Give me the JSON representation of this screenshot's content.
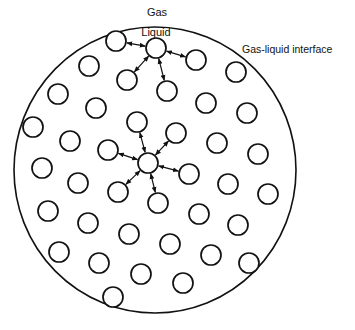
{
  "labels": {
    "gas": "Gas",
    "liquid": "Liquid",
    "interface": "Gas-liquid interface"
  },
  "colors": {
    "stroke": "#111111",
    "background": "#ffffff"
  },
  "droplet": {
    "cx": 155,
    "cy": 170,
    "rx": 141,
    "ry": 143
  },
  "molecule_radius": 10,
  "surface_group": {
    "center": [
      156,
      48
    ],
    "neighbors": [
      [
        116,
        41
      ],
      [
        196,
        60
      ],
      [
        127,
        80
      ],
      [
        167,
        91
      ]
    ]
  },
  "interior_group": {
    "center": [
      148,
      163
    ],
    "neighbors": [
      [
        137,
        122
      ],
      [
        176,
        133
      ],
      [
        108,
        150
      ],
      [
        189,
        174
      ],
      [
        118,
        192
      ],
      [
        158,
        203
      ]
    ]
  },
  "other_molecules": [
    [
      89,
      66
    ],
    [
      236,
      72
    ],
    [
      58,
      94
    ],
    [
      96,
      108
    ],
    [
      206,
      103
    ],
    [
      247,
      113
    ],
    [
      33,
      127
    ],
    [
      70,
      141
    ],
    [
      217,
      143
    ],
    [
      258,
      154
    ],
    [
      42,
      168
    ],
    [
      78,
      183
    ],
    [
      228,
      184
    ],
    [
      268,
      194
    ],
    [
      48,
      211
    ],
    [
      88,
      223
    ],
    [
      199,
      214
    ],
    [
      238,
      225
    ],
    [
      129,
      234
    ],
    [
      59,
      252
    ],
    [
      99,
      263
    ],
    [
      170,
      244
    ],
    [
      211,
      255
    ],
    [
      249,
      263
    ],
    [
      141,
      274
    ],
    [
      113,
      297
    ],
    [
      183,
      283
    ]
  ]
}
